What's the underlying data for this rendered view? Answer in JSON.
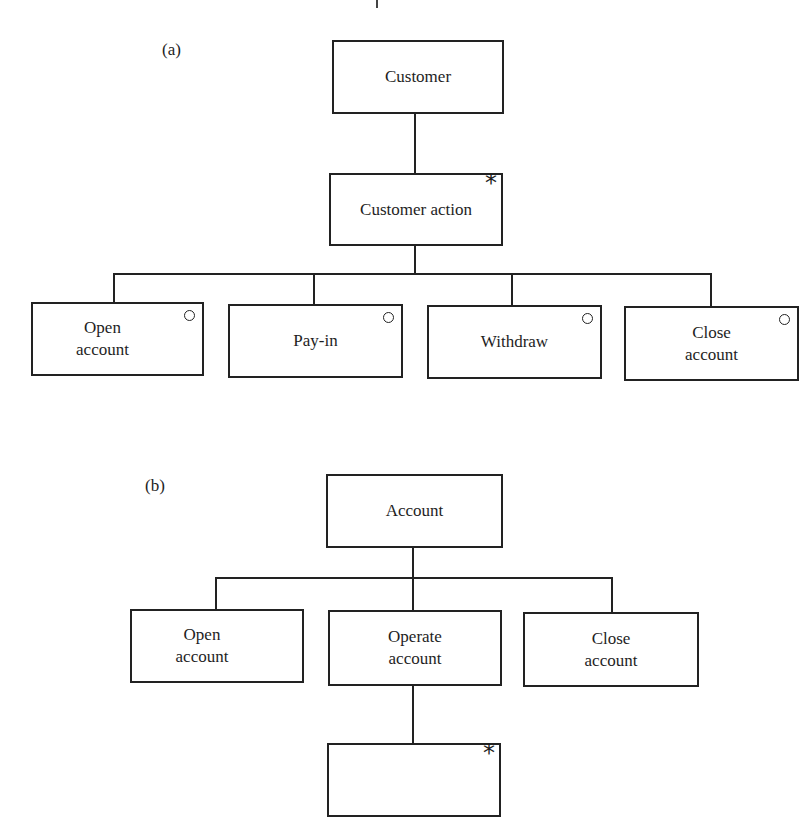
{
  "diagram_a": {
    "label": "(a)",
    "root": {
      "text": "Customer"
    },
    "iteration": {
      "text": "Customer action",
      "marker": "*"
    },
    "selections": [
      {
        "text": "Open\naccount",
        "marker": "o"
      },
      {
        "text": "Pay-in",
        "marker": "o"
      },
      {
        "text": "Withdraw",
        "marker": "o"
      },
      {
        "text": "Close\naccount",
        "marker": "o"
      }
    ]
  },
  "diagram_b": {
    "label": "(b)",
    "root": {
      "text": "Account"
    },
    "sequence": [
      {
        "text": "Open\naccount"
      },
      {
        "text": "Operate\naccount"
      },
      {
        "text": "Close\naccount"
      }
    ],
    "iteration": {
      "text": "",
      "marker": "*"
    }
  }
}
